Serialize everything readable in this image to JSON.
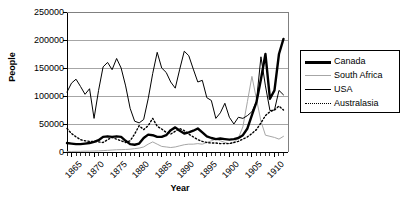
{
  "chart_data": {
    "type": "line",
    "title": "",
    "xlabel": "Year",
    "ylabel": "People",
    "xlim": [
      1864,
      1913
    ],
    "ylim": [
      0,
      250000
    ],
    "ytick_labels": [
      "250000",
      "200000",
      "150000",
      "100000",
      "50000",
      "0"
    ],
    "ytick_values": [
      250000,
      200000,
      150000,
      100000,
      50000,
      0
    ],
    "xtick_labels": [
      "1865",
      "1870",
      "1875",
      "1880",
      "1885",
      "1890",
      "1895",
      "1900",
      "1905",
      "1910"
    ],
    "xtick_values": [
      1865,
      1870,
      1875,
      1880,
      1885,
      1890,
      1895,
      1900,
      1905,
      1910
    ],
    "grid": "horizontal",
    "legend_position": "right-outside",
    "x": [
      1864,
      1865,
      1866,
      1867,
      1868,
      1869,
      1870,
      1871,
      1872,
      1873,
      1874,
      1875,
      1876,
      1877,
      1878,
      1879,
      1880,
      1881,
      1882,
      1883,
      1884,
      1885,
      1886,
      1887,
      1888,
      1889,
      1890,
      1891,
      1892,
      1893,
      1894,
      1895,
      1896,
      1897,
      1898,
      1899,
      1900,
      1901,
      1902,
      1903,
      1904,
      1905,
      1906,
      1907,
      1908,
      1909,
      1910,
      1911,
      1912
    ],
    "series": [
      {
        "name": "Canada",
        "style": "thick-solid",
        "color": "#000000",
        "width": 2.4,
        "values": [
          16000,
          15000,
          14000,
          14000,
          15000,
          16000,
          18000,
          21000,
          27000,
          28000,
          27000,
          28000,
          27000,
          20000,
          14000,
          13000,
          15000,
          25000,
          31000,
          30000,
          27000,
          27000,
          30000,
          39000,
          44000,
          38000,
          33000,
          35000,
          38000,
          42000,
          35000,
          28000,
          25000,
          23000,
          24000,
          23000,
          22000,
          23000,
          25000,
          30000,
          42000,
          66000,
          89000,
          130000,
          175000,
          95000,
          110000,
          175000,
          202000
        ]
      },
      {
        "name": "South Africa",
        "style": "thin-solid",
        "color": "#a6a6a6",
        "width": 1,
        "values": [
          1000,
          1000,
          1200,
          1200,
          1500,
          1500,
          1800,
          2000,
          2500,
          3000,
          3500,
          4000,
          4200,
          4500,
          5000,
          6000,
          7000,
          9000,
          14000,
          18000,
          14000,
          10000,
          9000,
          8000,
          9000,
          11000,
          13000,
          14000,
          14000,
          15000,
          14000,
          17000,
          20000,
          23000,
          20000,
          17000,
          15000,
          17000,
          25000,
          45000,
          90000,
          135000,
          95000,
          55000,
          30000,
          28000,
          26000,
          23000,
          28000
        ]
      },
      {
        "name": "USA",
        "style": "thin-solid",
        "color": "#000000",
        "width": 1,
        "values": [
          107000,
          123000,
          130000,
          117000,
          103000,
          113000,
          60000,
          110000,
          152000,
          160000,
          147000,
          167000,
          150000,
          118000,
          78000,
          55000,
          52000,
          58000,
          95000,
          140000,
          178000,
          150000,
          142000,
          125000,
          114000,
          148000,
          180000,
          172000,
          148000,
          125000,
          128000,
          97000,
          92000,
          60000,
          70000,
          87000,
          62000,
          50000,
          62000,
          60000,
          65000,
          72000,
          90000,
          170000,
          118000,
          74000,
          75000,
          110000,
          102000
        ]
      },
      {
        "name": "Australasia",
        "style": "dotted",
        "color": "#000000",
        "width": 1.4,
        "values": [
          42000,
          33000,
          27000,
          22000,
          20000,
          19000,
          19000,
          18000,
          17000,
          22000,
          26000,
          23000,
          20000,
          17000,
          20000,
          32000,
          47000,
          40000,
          47000,
          60000,
          46000,
          41000,
          35000,
          32000,
          37000,
          42000,
          38000,
          32000,
          27000,
          22000,
          19000,
          17000,
          16000,
          16000,
          15000,
          15000,
          15000,
          17000,
          19000,
          23000,
          27000,
          33000,
          40000,
          52000,
          65000,
          72000,
          75000,
          82000,
          75000
        ]
      }
    ]
  },
  "legend": {
    "items": [
      {
        "label": "Canada"
      },
      {
        "label": "South Africa"
      },
      {
        "label": "USA"
      },
      {
        "label": "Australasia"
      }
    ]
  }
}
